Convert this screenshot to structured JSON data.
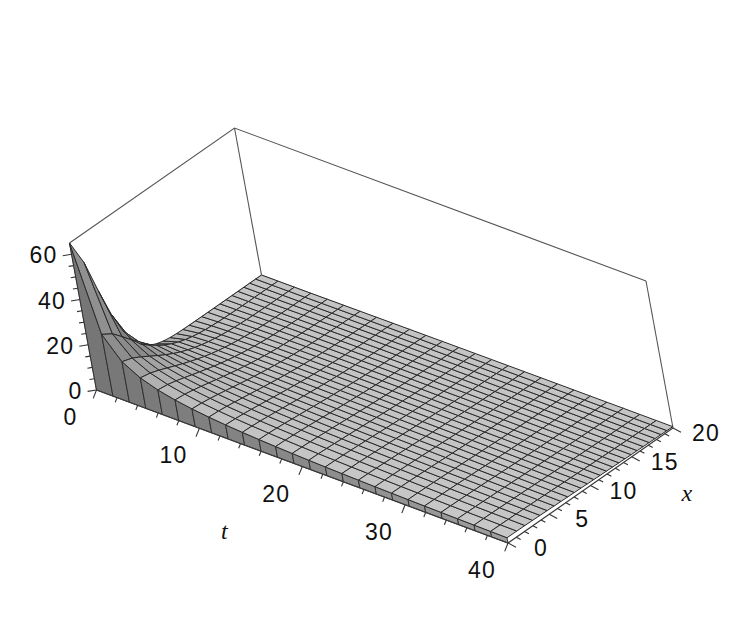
{
  "figure": {
    "type": "surface3d-plot",
    "background_color": "#ffffff",
    "mesh_line_color": "#1c1c1c",
    "surface_fill_light": "#c9c9c9",
    "surface_fill_mid": "#9d9d9d",
    "surface_fill_dark": "#6f6f6f",
    "box_line_color": "#555555"
  },
  "axes": {
    "t": {
      "title": "t",
      "ticks": [
        "0",
        "10",
        "20",
        "30",
        "40"
      ],
      "values": [
        0,
        10,
        20,
        30,
        40
      ],
      "range": [
        0,
        40
      ]
    },
    "x": {
      "title": "x",
      "ticks": [
        "0",
        "5",
        "10",
        "15",
        "20"
      ],
      "values": [
        0,
        5,
        10,
        15,
        20
      ],
      "range": [
        0,
        20
      ]
    },
    "z": {
      "title": "",
      "ticks": [
        "0",
        "20",
        "40",
        "60"
      ],
      "values": [
        0,
        20,
        40,
        60
      ],
      "range": [
        0,
        65
      ]
    }
  },
  "chart_data": {
    "type": "surface",
    "title": "",
    "xlabel": "t",
    "ylabel": "x",
    "zlabel": "",
    "xlim": [
      0,
      40
    ],
    "ylim": [
      0,
      20
    ],
    "zlim": [
      0,
      65
    ],
    "grid": false,
    "legend": "none",
    "x_ticks": [
      0,
      10,
      20,
      30,
      40
    ],
    "y_ticks": [
      0,
      5,
      10,
      15,
      20
    ],
    "z_ticks": [
      0,
      20,
      40,
      60
    ],
    "mesh_samples": {
      "t": 26,
      "x": 26
    },
    "surface_values": {
      "t": [
        0,
        8,
        16,
        24,
        32,
        40
      ],
      "x": [
        0,
        4,
        8,
        12,
        16,
        20
      ],
      "z": [
        [
          65,
          48,
          30,
          17,
          9,
          4
        ],
        [
          34,
          28,
          20,
          13,
          7,
          3
        ],
        [
          20,
          18,
          14,
          10,
          6,
          3
        ],
        [
          13,
          12,
          10,
          8,
          5,
          2
        ],
        [
          9,
          8,
          7,
          6,
          4,
          2
        ],
        [
          6,
          6,
          5,
          4,
          3,
          1
        ]
      ]
    }
  }
}
